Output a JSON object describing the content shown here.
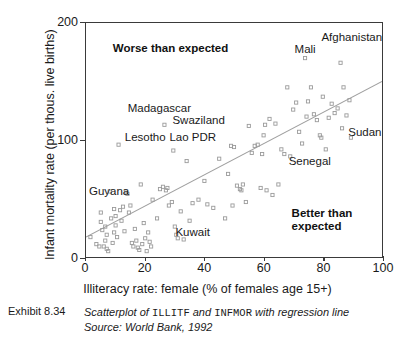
{
  "chart_data": {
    "type": "scatter",
    "title": "",
    "xlabel": "Illiteracy rate: female (% of females age 15+)",
    "ylabel": "Infant mortality rate (per thous. live births)",
    "xlim": [
      0,
      100
    ],
    "ylim": [
      0,
      200
    ],
    "xticks": [
      0,
      20,
      40,
      60,
      80,
      100
    ],
    "yticks": [
      0,
      100,
      200
    ],
    "grid": false,
    "legend": "none",
    "point_marker": "open-square",
    "point_color": "#9a9a9a",
    "regression_line": {
      "color": "#a0a0a0",
      "x": [
        0,
        100
      ],
      "y": [
        17,
        150
      ]
    },
    "series": [
      {
        "name": "Countries",
        "points": [
          [
            1.5,
            17
          ],
          [
            3.5,
            11
          ],
          [
            4.5,
            9
          ],
          [
            5.0,
            30
          ],
          [
            5.0,
            38
          ],
          [
            5.5,
            23
          ],
          [
            6.0,
            9
          ],
          [
            6.5,
            14
          ],
          [
            6.5,
            26
          ],
          [
            7.0,
            7
          ],
          [
            7.0,
            19
          ],
          [
            7.5,
            5
          ],
          [
            8.0,
            56
          ],
          [
            8.5,
            33
          ],
          [
            9.0,
            12
          ],
          [
            9.5,
            41
          ],
          [
            9.5,
            21
          ],
          [
            10.0,
            35
          ],
          [
            10.0,
            27
          ],
          [
            10.5,
            17
          ],
          [
            11.0,
            96
          ],
          [
            11.5,
            40
          ],
          [
            12.0,
            31
          ],
          [
            12.5,
            43
          ],
          [
            13.0,
            22
          ],
          [
            13.5,
            55
          ],
          [
            14.0,
            54
          ],
          [
            14.5,
            38
          ],
          [
            15.0,
            44
          ],
          [
            15.5,
            12
          ],
          [
            16.0,
            9
          ],
          [
            16.5,
            24
          ],
          [
            17.0,
            14
          ],
          [
            17.5,
            8
          ],
          [
            18.0,
            6
          ],
          [
            18.5,
            62
          ],
          [
            19.0,
            11
          ],
          [
            19.5,
            29
          ],
          [
            20.0,
            16
          ],
          [
            20.5,
            5
          ],
          [
            21.0,
            21
          ],
          [
            21.5,
            13
          ],
          [
            22.0,
            9
          ],
          [
            22.5,
            49
          ],
          [
            24.0,
            33
          ],
          [
            25.0,
            58
          ],
          [
            26.0,
            60
          ],
          [
            26.5,
            113
          ],
          [
            27.0,
            57
          ],
          [
            27.5,
            59
          ],
          [
            28.0,
            44
          ],
          [
            29.0,
            47
          ],
          [
            29.5,
            91
          ],
          [
            30.0,
            26
          ],
          [
            30.5,
            19
          ],
          [
            31.0,
            16
          ],
          [
            32.0,
            39
          ],
          [
            33.0,
            15
          ],
          [
            34.0,
            82
          ],
          [
            35.0,
            31
          ],
          [
            36.0,
            46
          ],
          [
            38.0,
            49
          ],
          [
            40.0,
            65
          ],
          [
            41.0,
            45
          ],
          [
            43.0,
            42
          ],
          [
            45.0,
            84
          ],
          [
            47.0,
            33
          ],
          [
            48.0,
            71
          ],
          [
            49.0,
            95
          ],
          [
            49.5,
            44
          ],
          [
            50.0,
            94
          ],
          [
            51.0,
            61
          ],
          [
            52.0,
            58
          ],
          [
            52.5,
            57
          ],
          [
            53.0,
            62
          ],
          [
            54.0,
            47
          ],
          [
            55.0,
            112
          ],
          [
            56.0,
            89
          ],
          [
            57.0,
            95
          ],
          [
            58.0,
            96
          ],
          [
            59.0,
            59
          ],
          [
            59.5,
            88
          ],
          [
            60.0,
            104
          ],
          [
            60.5,
            113
          ],
          [
            61.0,
            57
          ],
          [
            62.0,
            118
          ],
          [
            63.0,
            53
          ],
          [
            64.0,
            114
          ],
          [
            65.0,
            62
          ],
          [
            66.0,
            92
          ],
          [
            67.0,
            88
          ],
          [
            68.0,
            145
          ],
          [
            69.0,
            86
          ],
          [
            70.0,
            126
          ],
          [
            71.0,
            132
          ],
          [
            72.0,
            107
          ],
          [
            73.0,
            97
          ],
          [
            74.0,
            170
          ],
          [
            74.5,
            120
          ],
          [
            75.0,
            133
          ],
          [
            76.0,
            145
          ],
          [
            77.0,
            122
          ],
          [
            78.0,
            117
          ],
          [
            79.0,
            104
          ],
          [
            79.5,
            102
          ],
          [
            80.0,
            137
          ],
          [
            81.0,
            92
          ],
          [
            82.0,
            119
          ],
          [
            83.0,
            131
          ],
          [
            84.0,
            123
          ],
          [
            85.0,
            127
          ],
          [
            86.0,
            166
          ],
          [
            86.5,
            110
          ],
          [
            87.0,
            145
          ],
          [
            88.0,
            121
          ],
          [
            89.0,
            134
          ],
          [
            89.5,
            102
          ]
        ]
      }
    ],
    "region_notes": [
      {
        "name": "worse-than-expected",
        "text": "Worse than expected",
        "x": 9,
        "y": 178
      },
      {
        "name": "better-than-expected",
        "text": "Better than\nexpected",
        "x": 69,
        "y": 38
      }
    ],
    "country_labels": [
      {
        "name": "afghanistan",
        "text": "Afghanistan",
        "x": 79,
        "y": 188
      },
      {
        "name": "mali",
        "text": "Mali",
        "x": 70,
        "y": 178
      },
      {
        "name": "madagascar",
        "text": "Madagascar",
        "x": 14,
        "y": 128
      },
      {
        "name": "swaziland",
        "text": "Swaziland",
        "x": 29,
        "y": 118
      },
      {
        "name": "lesotho",
        "text": "Lesotho",
        "x": 13,
        "y": 103
      },
      {
        "name": "lao-pdr",
        "text": "Lao PDR",
        "x": 28,
        "y": 103
      },
      {
        "name": "sudan",
        "text": "Sudan",
        "x": 88,
        "y": 108
      },
      {
        "name": "senegal",
        "text": "Senegal",
        "x": 68,
        "y": 83
      },
      {
        "name": "guyana",
        "text": "Guyana",
        "x": 1,
        "y": 58
      },
      {
        "name": "kuwait",
        "text": "Kuwait",
        "x": 30,
        "y": 23
      }
    ]
  },
  "axes": {
    "x_tick_labels": [
      "0",
      "20",
      "40",
      "60",
      "80",
      "100"
    ],
    "y_tick_labels": [
      "0",
      "100",
      "200"
    ],
    "x_title": "Illiteracy rate: female (% of females age 15+)",
    "y_title": "Infant mortality rate (per thous. live births)"
  },
  "caption": {
    "exhibit_label": "Exhibit 8.34",
    "line1_pre": "Scatterplot of ",
    "line1_var1": "ILLITF",
    "line1_mid": " and ",
    "line1_var2": "INFMOR",
    "line1_post": " with regression line",
    "line2": "Source: World Bank, 1992"
  }
}
